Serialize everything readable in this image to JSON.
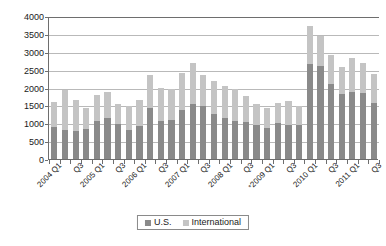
{
  "chart_data": {
    "type": "bar",
    "stacked": true,
    "title": "",
    "subtitle": "",
    "xlabel": "",
    "ylabel": "",
    "ylim": [
      0,
      4000
    ],
    "ytick_step": 500,
    "ytick_labels": [
      "0",
      "500",
      "1000",
      "1500",
      "2000",
      "2500",
      "3000",
      "3500",
      "4000"
    ],
    "grid": true,
    "grid_axis": "y",
    "legend_position": "bottom-center",
    "categories": [
      "2004 Q1",
      "2004 Q2",
      "2004 Q3",
      "2004 Q4",
      "2005 Q1",
      "2005 Q2",
      "2005 Q3",
      "2005 Q4",
      "2006 Q1",
      "2006 Q2",
      "2006 Q3",
      "2006 Q4",
      "2007 Q1",
      "2007 Q2",
      "2007 Q3",
      "2007 Q4",
      "2008 Q1",
      "2008 Q2",
      "2008 Q3",
      "2008 Q4",
      "2009 Q1",
      "2009 Q2",
      "2009 Q3",
      "2009 Q4",
      "2010 Q1",
      "2010 Q2",
      "2010 Q3",
      "2010 Q4",
      "2011 Q1",
      "2011 Q2",
      "2011 Q3"
    ],
    "x_tick_labels": [
      {
        "index": 0,
        "text": "2004 Q1",
        "starred": false
      },
      {
        "index": 2,
        "text": "Q3",
        "starred": false
      },
      {
        "index": 4,
        "text": "2005 Q1",
        "starred": false
      },
      {
        "index": 6,
        "text": "Q3",
        "starred": false
      },
      {
        "index": 8,
        "text": "2006 Q1",
        "starred": false
      },
      {
        "index": 10,
        "text": "Q3",
        "starred": false
      },
      {
        "index": 12,
        "text": "2007 Q1",
        "starred": false
      },
      {
        "index": 14,
        "text": "Q3",
        "starred": false
      },
      {
        "index": 16,
        "text": "2008 Q1",
        "starred": false
      },
      {
        "index": 18,
        "text": "Q3",
        "starred": false
      },
      {
        "index": 20,
        "text": "2009 Q1",
        "starred": true
      },
      {
        "index": 22,
        "text": "Q3",
        "starred": false
      },
      {
        "index": 24,
        "text": "2010 Q1",
        "starred": false
      },
      {
        "index": 26,
        "text": "Q3",
        "starred": false
      },
      {
        "index": 28,
        "text": "2011 Q1",
        "starred": false
      },
      {
        "index": 30,
        "text": "Q3",
        "starred": false
      }
    ],
    "series": [
      {
        "name": "U.S.",
        "color": "#8a8a8a",
        "values": [
          900,
          800,
          780,
          840,
          1070,
          1160,
          970,
          800,
          930,
          1420,
          1050,
          1090,
          1360,
          1540,
          1470,
          1260,
          1140,
          1060,
          1030,
          950,
          870,
          1010,
          960,
          940,
          2670,
          2590,
          2110,
          1810,
          1870,
          1860,
          1570
        ]
      },
      {
        "name": "International",
        "color": "#c4c4c4",
        "values": [
          700,
          1120,
          870,
          580,
          720,
          710,
          580,
          670,
          710,
          920,
          940,
          860,
          1050,
          1150,
          890,
          910,
          890,
          890,
          740,
          590,
          560,
          560,
          650,
          550,
          1050,
          860,
          800,
          770,
          950,
          830,
          800
        ]
      }
    ],
    "totals": [
      1600,
      1920,
      1650,
      1420,
      1790,
      1870,
      1550,
      1470,
      1640,
      2340,
      1990,
      1950,
      2410,
      2690,
      2360,
      2170,
      2030,
      1950,
      1770,
      1540,
      1430,
      1570,
      1610,
      1490,
      3720,
      3450,
      2910,
      2580,
      2820,
      2690,
      2370
    ]
  },
  "legend": {
    "entries": [
      {
        "label": "U.S.",
        "swatch": "us"
      },
      {
        "label": "International",
        "swatch": "intl"
      }
    ]
  },
  "colors": {
    "us": "#8a8a8a",
    "international": "#c4c4c4",
    "axis": "#6e6e6e",
    "gridline": "#b9b9b9",
    "text": "#1a1a1a",
    "background": "#ffffff"
  }
}
